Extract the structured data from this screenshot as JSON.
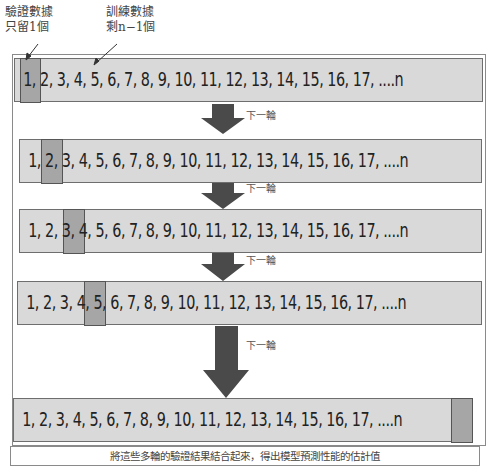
{
  "callouts": {
    "validation": {
      "line1": "驗證數據",
      "line2": "只留1個"
    },
    "training": {
      "line1": "訓練數據",
      "line2": "剩n−1個"
    }
  },
  "rows": [
    {
      "sequence": "1, 2, 3, 4, 5, 6, 7, 8, 9, 10, 11, 12, 13, 14, 15, 16, 17, ....n",
      "validation_index": "1"
    },
    {
      "sequence": "1, 2, 3, 4, 5, 6, 7, 8, 9, 10, 11, 12, 13, 14, 15, 16, 17, ....n",
      "validation_index": "2"
    },
    {
      "sequence": "1, 2, 3, 4, 5, 6, 7, 8, 9, 10, 11, 12, 13, 14, 15, 16, 17, ....n",
      "validation_index": "3"
    },
    {
      "sequence": "1, 2, 3, 4, 5, 6, 7, 8, 9, 10, 11, 12, 13, 14, 15, 16, 17, ....n",
      "validation_index": "4"
    },
    {
      "sequence": "1, 2, 3, 4, 5, 6, 7, 8, 9, 10, 11, 12, 13, 14, 15, 16, 17, ....n",
      "validation_index": "n"
    }
  ],
  "arrows": [
    {
      "label": "下一輪"
    },
    {
      "label": "下一輪"
    },
    {
      "label": "下一輪"
    },
    {
      "label": "下一輪"
    }
  ],
  "caption": "將這些多輪的驗證結果結合起來，得出模型預測性能的估計值",
  "colors": {
    "row_fill": "#d9d9d9",
    "highlight_fill": "#a6a6a6",
    "arrow": "#4a4a4a",
    "border": "#6e6e6e"
  }
}
